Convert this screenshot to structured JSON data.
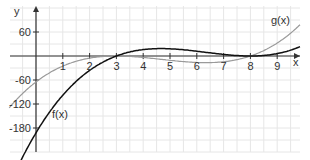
{
  "chart_data": {
    "type": "line",
    "title": "",
    "xlabel": "x",
    "ylabel": "y",
    "xlim": [
      -0.95,
      9.9
    ],
    "ylim": [
      -240,
      120
    ],
    "grid": true,
    "x_ticks": [
      "1",
      "2",
      "3",
      "4",
      "5",
      "6",
      "7",
      "8",
      "9"
    ],
    "y_ticks": [
      "60",
      "-60",
      "-120",
      "-180"
    ],
    "series": [
      {
        "name": "f(x)",
        "color": "#111111",
        "formula": "(x-3)*(x-8)^2",
        "x": [
          -0.4,
          0,
          1,
          2,
          3,
          4,
          5,
          6,
          7,
          8,
          9,
          9.8
        ],
        "values": [
          -250,
          -192,
          -98,
          -36,
          0,
          16,
          18,
          12,
          4,
          0,
          6,
          23
        ]
      },
      {
        "name": "g(x)",
        "color": "#999999",
        "formula": "0.9*(x-3)^2*(x-8)",
        "x": [
          -0.9,
          0,
          1,
          2,
          3,
          4,
          5,
          6,
          7,
          8,
          9,
          9.8
        ],
        "values": [
          -122,
          -65,
          -25,
          -5,
          0,
          -3,
          -11,
          -14,
          -14,
          0,
          32,
          75
        ]
      }
    ],
    "legend": "inline labels"
  },
  "labels": {
    "x_axis": "x",
    "y_axis": "y",
    "f": "f(x)",
    "g": "g(x)",
    "xt": [
      "1",
      "2",
      "3",
      "4",
      "5",
      "6",
      "7",
      "8",
      "9"
    ],
    "yt": [
      "60",
      "-60",
      "-120",
      "-180"
    ]
  }
}
